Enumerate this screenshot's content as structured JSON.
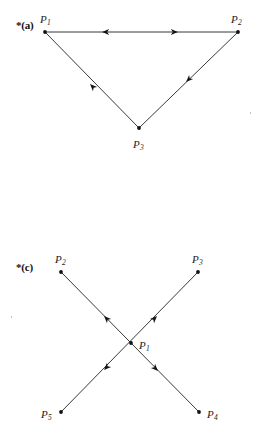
{
  "page": {
    "width": 263,
    "height": 443,
    "background": "#ffffff",
    "ink_color": "#1d1d1d"
  },
  "figures": [
    {
      "id": "figure-a",
      "label": "*(a)",
      "label_position": {
        "x": 16,
        "y": 20
      },
      "type": "directed-graph",
      "description": "Triangle with apex pointing down; three vertices P1, P2, P3",
      "vertices": [
        {
          "name": "P",
          "subscript": "1",
          "x": 45,
          "y": 32,
          "label_x": 40,
          "label_y": 14
        },
        {
          "name": "P",
          "subscript": "2",
          "x": 238,
          "y": 32,
          "label_x": 231,
          "label_y": 14
        },
        {
          "name": "P",
          "subscript": "3",
          "x": 139,
          "y": 128,
          "label_x": 133,
          "label_y": 139
        }
      ],
      "edges": [
        {
          "id": "edge-p1-p2",
          "from": "P1",
          "to": "P2",
          "x1": 45,
          "y1": 32,
          "x2": 238,
          "y2": 32,
          "arrows": [
            {
              "at_x": 102,
              "at_y": 32,
              "direction": "left",
              "points_to": "P1"
            },
            {
              "at_x": 178,
              "at_y": 32,
              "direction": "right",
              "points_to": "P2"
            }
          ]
        },
        {
          "id": "edge-p3-p1",
          "from": "P3",
          "to": "P1",
          "x1": 139,
          "y1": 128,
          "x2": 45,
          "y2": 32,
          "arrows": [
            {
              "at_x": 90,
              "at_y": 84,
              "direction": "up-left",
              "points_to": "P1"
            }
          ]
        },
        {
          "id": "edge-p2-p3",
          "from": "P2",
          "to": "P3",
          "x1": 238,
          "y1": 32,
          "x2": 139,
          "y2": 128,
          "arrows": [
            {
              "at_x": 186,
              "at_y": 82,
              "direction": "down-left",
              "points_to": "P3"
            }
          ]
        }
      ]
    },
    {
      "id": "figure-c",
      "label": "*(c)",
      "label_position": {
        "x": 16,
        "y": 262
      },
      "type": "directed-graph",
      "description": "Two crossing lines forming an X meeting at P1; outer vertices P2, P3, P4, P5",
      "vertices": [
        {
          "name": "P",
          "subscript": "2",
          "x": 61,
          "y": 272,
          "label_x": 55,
          "label_y": 254
        },
        {
          "name": "P",
          "subscript": "3",
          "x": 198,
          "y": 272,
          "label_x": 192,
          "label_y": 254
        },
        {
          "name": "P",
          "subscript": "1",
          "x": 131,
          "y": 343,
          "label_x": 139,
          "label_y": 340
        },
        {
          "name": "P",
          "subscript": "5",
          "x": 61,
          "y": 412,
          "label_x": 41,
          "label_y": 409
        },
        {
          "name": "P",
          "subscript": "4",
          "x": 199,
          "y": 412,
          "label_x": 207,
          "label_y": 409
        }
      ],
      "edges": [
        {
          "id": "edge-p4-p2",
          "from": "P4",
          "to": "P2",
          "x1": 199,
          "y1": 412,
          "x2": 61,
          "y2": 272,
          "arrows": [
            {
              "at_x": 104,
              "at_y": 316,
              "direction": "up-left",
              "points_to": "P2"
            },
            {
              "at_x": 158,
              "at_y": 371,
              "direction": "down-right",
              "points_to": "P4"
            }
          ]
        },
        {
          "id": "edge-p5-p3",
          "from": "P5",
          "to": "P3",
          "x1": 61,
          "y1": 412,
          "x2": 198,
          "y2": 272,
          "arrows": [
            {
              "at_x": 157,
              "at_y": 316,
              "direction": "up-right",
              "points_to": "P3"
            },
            {
              "at_x": 104,
              "at_y": 370,
              "direction": "down-left",
              "points_to": "P5"
            }
          ]
        }
      ]
    }
  ],
  "specks": [
    {
      "x": 11,
      "y": 316
    },
    {
      "x": 250,
      "y": 112
    }
  ]
}
